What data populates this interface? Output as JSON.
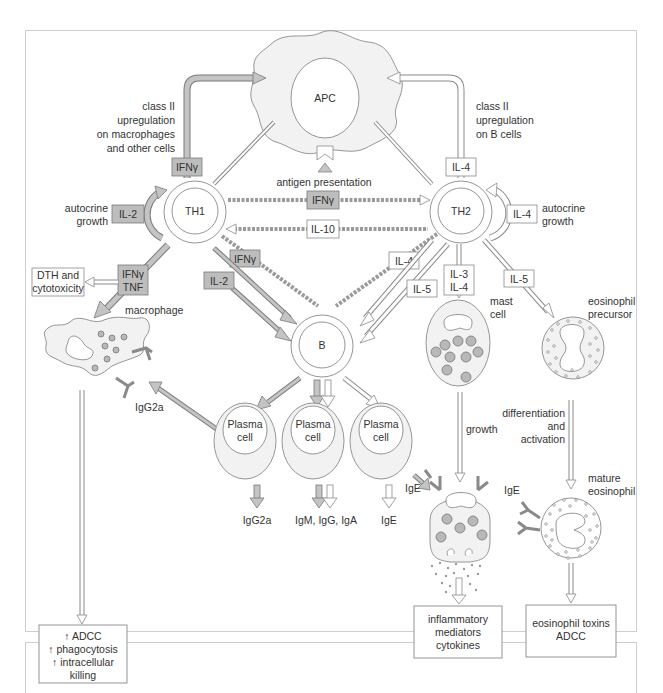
{
  "diagram": {
    "nodes": {
      "apc": {
        "label": "APC"
      },
      "th1": {
        "label": "TH1"
      },
      "th2": {
        "label": "TH2"
      },
      "b": {
        "label": "B"
      },
      "plasma_1": {
        "label_line1": "Plasma",
        "label_line2": "cell"
      },
      "plasma_2": {
        "label_line1": "Plasma",
        "label_line2": "cell"
      },
      "plasma_3": {
        "label_line1": "Plasma",
        "label_line2": "cell"
      },
      "macrophage": {
        "label": "macrophage"
      },
      "mast_cell": {
        "label_line1": "mast",
        "label_line2": "cell"
      },
      "eosinophil_precursor": {
        "label_line1": "eosinophil",
        "label_line2": "precursor"
      },
      "mature_eosinophil": {
        "label_line1": "mature",
        "label_line2": "eosinophil"
      }
    },
    "cytokines": {
      "ifng_apc": "IFNγ",
      "il4_apc": "IL-4",
      "il2_autocrine": "IL-2",
      "il4_autocrine": "IL-4",
      "ifng_th1_th2": "IFNγ",
      "il10_th2_th1": "IL-10",
      "ifng_th1_b": "IFNγ",
      "il2_th1_b": "IL-2",
      "il4_th2_b": "IL-4",
      "il5_th2_b": "IL-5",
      "il3_mast": "IL-3",
      "il4_mast": "IL-4",
      "il5_eos": "IL-5",
      "ifng_macro": "IFNγ",
      "tnf_macro": "TNF"
    },
    "annotations": {
      "class2_left": [
        "class II",
        "upregulation",
        "on macrophages",
        "and other cells"
      ],
      "class2_right": [
        "class II",
        "upregulation",
        "on B cells"
      ],
      "antigen_presentation": "antigen presentation",
      "autocrine_left": [
        "autocrine",
        "growth"
      ],
      "autocrine_right": [
        "autocrine",
        "growth"
      ],
      "dth": [
        "DTH and",
        "cytotoxicity"
      ],
      "igg2a_macro": "IgG2a",
      "ige_mast": "IgE",
      "ige_eos": "IgE",
      "growth": "growth",
      "diff": [
        "differentiation",
        "and",
        "activation"
      ]
    },
    "antibody_outputs": {
      "p1": "IgG2a",
      "p2": "IgM, IgG, IgA",
      "p3": "IgE"
    },
    "outcome_boxes": {
      "macrophage_out": [
        "↑ ADCC",
        "↑ phagocytosis",
        "↑ intracellular",
        "killing"
      ],
      "mast_out": [
        "inflammatory",
        "mediators",
        "cytokines"
      ],
      "eos_out": [
        "eosinophil toxins",
        "ADCC"
      ]
    },
    "colors": {
      "th1_fill": "#bdbdbd",
      "th2_fill": "#ffffff",
      "cell_fill": "#f2f2f2",
      "stroke": "#8a8a8a"
    }
  }
}
